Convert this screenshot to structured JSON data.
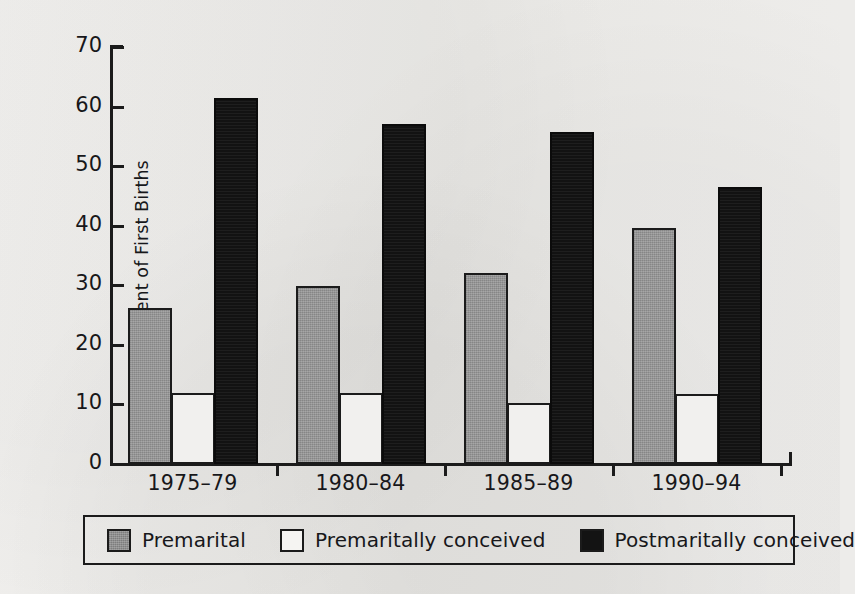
{
  "chart_data": {
    "type": "bar",
    "title": "",
    "xlabel": "",
    "ylabel": "Percent of First Births",
    "ylim": [
      0,
      70
    ],
    "yticks": [
      0,
      10,
      20,
      30,
      40,
      50,
      60,
      70
    ],
    "ytick_labels": [
      "0",
      "10",
      "20",
      "30",
      "40",
      "50",
      "60",
      "70"
    ],
    "grid": false,
    "legend_position": "bottom",
    "categories": [
      "1975–79",
      "1980–84",
      "1985–89",
      "1990–94"
    ],
    "series": [
      {
        "name": "Premarital",
        "color": "#959595",
        "values": [
          26.2,
          29.9,
          32.1,
          39.6
        ]
      },
      {
        "name": "Premaritally conceived",
        "color": "#ffffff",
        "values": [
          11.9,
          11.9,
          10.2,
          11.8
        ]
      },
      {
        "name": "Postmaritally conceived",
        "color": "#121212",
        "values": [
          61.4,
          57.1,
          55.8,
          46.5
        ]
      }
    ]
  },
  "axis": {
    "y_title": "Percent of First Births"
  },
  "legend": {
    "items": [
      {
        "label": "Premarital",
        "swatch": "gray-swatch"
      },
      {
        "label": "Premaritally conceived",
        "swatch": "white-swatch"
      },
      {
        "label": "Postmaritally conceived",
        "swatch": "black-swatch"
      }
    ]
  }
}
